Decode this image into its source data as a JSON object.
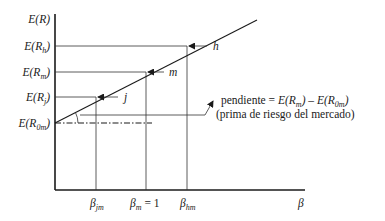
{
  "diagram": {
    "type": "security-market-line",
    "y_axis": {
      "title": {
        "main": "E(R)",
        "prefix": "E(",
        "var": "R",
        "suffix": ")"
      },
      "labels": [
        {
          "id": "h",
          "prefix": "E(",
          "var": "R",
          "sub": "h",
          "suffix": ")"
        },
        {
          "id": "m",
          "prefix": "E(",
          "var": "R",
          "sub": "m",
          "suffix": ")"
        },
        {
          "id": "j",
          "prefix": "E(",
          "var": "R",
          "sub": "j",
          "suffix": ")"
        },
        {
          "id": "0m",
          "prefix": "E(",
          "var": "R",
          "sub": "0m",
          "suffix": ")"
        }
      ]
    },
    "x_axis": {
      "title": "β",
      "labels": [
        {
          "id": "jm",
          "var": "β",
          "sub": "jm",
          "rest": ""
        },
        {
          "id": "m",
          "var": "β",
          "sub": "m",
          "rest": " = 1"
        },
        {
          "id": "hm",
          "var": "β",
          "sub": "hm",
          "rest": ""
        }
      ]
    },
    "points": [
      {
        "label": "j"
      },
      {
        "label": "m"
      },
      {
        "label": "h"
      }
    ],
    "slope_note": {
      "line1_prefix": "pendiente = ",
      "line1_term1": "E(R",
      "line1_term1_sub": "m",
      "line1_term1_close": ")",
      "line1_minus": " – ",
      "line1_term2": "E(R",
      "line1_term2_sub": "0m",
      "line1_term2_close": ")",
      "line2": "(prima de riesgo del mercado)"
    }
  }
}
